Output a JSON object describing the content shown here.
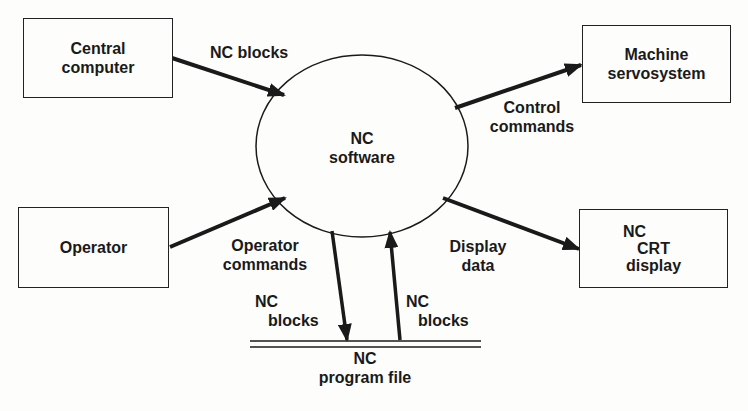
{
  "nodes": {
    "central_computer": {
      "line1": "Central",
      "line2": "computer"
    },
    "operator": {
      "line1": "Operator"
    },
    "nc_software": {
      "line1": "NC",
      "line2": "software"
    },
    "machine_servosystem": {
      "line1": "Machine",
      "line2": "servosystem"
    },
    "nc_crt_display": {
      "line1": "NC",
      "line2": "CRT",
      "line3": "display"
    },
    "nc_program_file": {
      "line1": "NC",
      "line2": "program file"
    }
  },
  "edges": {
    "central_to_software": {
      "line1": "NC blocks"
    },
    "operator_to_software": {
      "line1": "Operator",
      "line2": "commands"
    },
    "software_to_servo": {
      "line1": "Control",
      "line2": "commands"
    },
    "software_to_display": {
      "line1": "Display",
      "line2": "data"
    },
    "software_to_file": {
      "line1": "NC",
      "line2": "blocks"
    },
    "file_to_software": {
      "line1": "NC",
      "line2": "blocks"
    }
  },
  "colors": {
    "line": "#1a1a1a",
    "background": "#fdfdfb"
  }
}
